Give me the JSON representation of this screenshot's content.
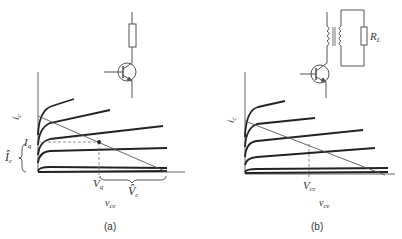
{
  "figure_a": {
    "caption": "(a)",
    "y_axis_label": "i",
    "y_axis_sub": "c",
    "x_axis_label": "v",
    "x_axis_sub": "ce",
    "iq_label": "I",
    "iq_sub": "q",
    "ic_peak_label": "Î",
    "ic_peak_sub": "c",
    "vq_label": "V",
    "vq_sub": "q",
    "vc_peak_label": "V̂",
    "vc_peak_sub": "c",
    "circuit": "transistor with collector resistor load"
  },
  "figure_b": {
    "caption": "(b)",
    "y_axis_label": "i",
    "y_axis_sub": "c",
    "x_axis_label": "v",
    "x_axis_sub": "ce",
    "vcc_label": "V",
    "vcc_sub": "cc",
    "rl_label": "R",
    "rl_sub": "L",
    "circuit": "transistor with transformer-coupled load R_L"
  },
  "colors": {
    "line": "#222222",
    "thin": "#555555",
    "dash": "#777777"
  }
}
